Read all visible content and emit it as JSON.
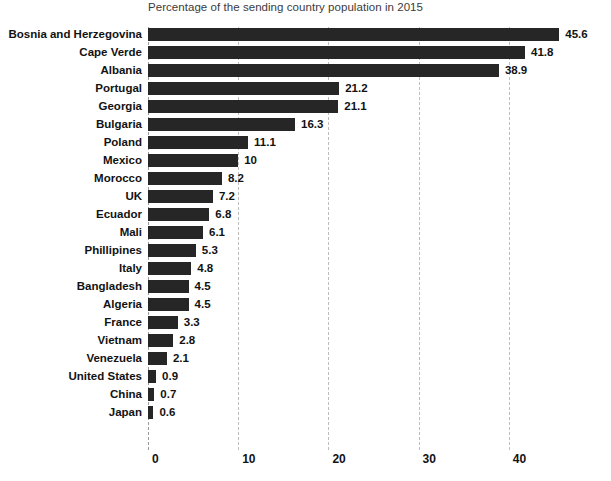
{
  "chart_data": {
    "type": "bar",
    "orientation": "horizontal",
    "title": "Percentage of the sending country population in 2015",
    "xlabel": "",
    "ylabel": "",
    "xlim": [
      0,
      46
    ],
    "xticks": [
      "0",
      "10",
      "20",
      "30",
      "40"
    ],
    "xtick_values": [
      0,
      10,
      20,
      30,
      40
    ],
    "grid": "vertical dashed gridlines at each x tick",
    "legend": "none",
    "bar_color": "#262626",
    "background_color": "#ffffff",
    "gridline_color": "#bdbdbd",
    "categories": [
      "Bosnia and Herzegovina",
      "Cape Verde",
      "Albania",
      "Portugal",
      "Georgia",
      "Bulgaria",
      "Poland",
      "Mexico",
      "Morocco",
      "UK",
      "Ecuador",
      "Mali",
      "Phillipines",
      "Italy",
      "Bangladesh",
      "Algeria",
      "France",
      "Vietnam",
      "Venezuela",
      "United States",
      "China",
      "Japan"
    ],
    "values": [
      45.6,
      41.8,
      38.9,
      21.2,
      21.1,
      16.3,
      11.1,
      10,
      8.2,
      7.2,
      6.8,
      6.1,
      5.3,
      4.8,
      4.5,
      4.5,
      3.3,
      2.8,
      2.1,
      0.9,
      0.7,
      0.6
    ],
    "value_labels": [
      "45.6",
      "41.8",
      "38.9",
      "21.2",
      "21.1",
      "16.3",
      "11.1",
      "10",
      "8.2",
      "7.2",
      "6.8",
      "6.1",
      "5.3",
      "4.8",
      "4.5",
      "4.5",
      "3.3",
      "2.8",
      "2.1",
      "0.9",
      "0.7",
      "0.6"
    ]
  }
}
